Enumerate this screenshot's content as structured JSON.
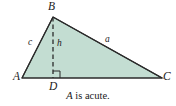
{
  "figure": {
    "type": "geometry-diagram",
    "caption": "A is acute.",
    "caption_variable": "A",
    "caption_rest": " is acute.",
    "colors": {
      "fill": "#c3ddd2",
      "stroke": "#2b2b2b",
      "dash": "#2b2b2b",
      "background": "#ffffff",
      "text": "#1a1a1a"
    },
    "vertices": [
      {
        "name": "vertex-B",
        "label": "B",
        "x": 53,
        "y": 17
      },
      {
        "name": "vertex-A",
        "label": "A",
        "x": 22,
        "y": 78
      },
      {
        "name": "vertex-C",
        "label": "C",
        "x": 162,
        "y": 78
      },
      {
        "name": "foot-D",
        "label": "D",
        "x": 53,
        "y": 78
      }
    ],
    "sides": [
      {
        "name": "side-c",
        "label": "c",
        "from": "A",
        "to": "B"
      },
      {
        "name": "side-a",
        "label": "a",
        "from": "B",
        "to": "C"
      },
      {
        "name": "altitude-h",
        "label": "h",
        "from": "B",
        "to": "D",
        "style": "dashed"
      }
    ],
    "marks": [
      {
        "name": "right-angle-mark",
        "at": "D",
        "size": 7
      }
    ],
    "polygon_points": "22,78 53,17 162,78",
    "baseline": {
      "x1": 22,
      "y1": 78,
      "x2": 162,
      "y2": 78
    }
  }
}
